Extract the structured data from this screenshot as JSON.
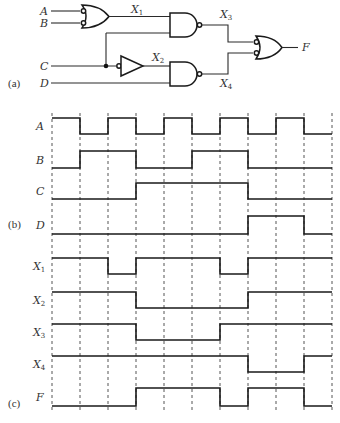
{
  "figure": {
    "part_labels": {
      "a": "(a)",
      "b": "(b)",
      "c": "(c)"
    },
    "circuit": {
      "inputs": [
        "A",
        "B",
        "C",
        "D"
      ],
      "intermediate": [
        {
          "name": "X",
          "sub": "1"
        },
        {
          "name": "X",
          "sub": "2"
        },
        {
          "name": "X",
          "sub": "3"
        },
        {
          "name": "X",
          "sub": "4"
        }
      ],
      "output": "F",
      "gates": [
        {
          "id": "g1",
          "type": "OR with inverted inputs",
          "inputs": [
            "A",
            "B"
          ],
          "output": "X1"
        },
        {
          "id": "g2",
          "type": "inverter",
          "inputs": [
            "C"
          ],
          "output": "X2"
        },
        {
          "id": "g3",
          "type": "NAND",
          "inputs": [
            "X1",
            "C"
          ],
          "output": "X3"
        },
        {
          "id": "g4",
          "type": "NAND",
          "inputs": [
            "X2",
            "D"
          ],
          "output": "X4"
        },
        {
          "id": "g5",
          "type": "OR with inverted inputs",
          "inputs": [
            "X3",
            "X4"
          ],
          "output": "F"
        }
      ]
    },
    "timing": {
      "intervals": 10,
      "signals": [
        {
          "name": "A",
          "sub": "",
          "values": [
            1,
            0,
            1,
            0,
            1,
            0,
            1,
            0,
            1,
            0
          ]
        },
        {
          "name": "B",
          "sub": "",
          "values": [
            0,
            1,
            1,
            0,
            0,
            1,
            1,
            0,
            0,
            0
          ]
        },
        {
          "name": "C",
          "sub": "",
          "values": [
            0,
            0,
            0,
            1,
            1,
            1,
            1,
            0,
            0,
            0
          ]
        },
        {
          "name": "D",
          "sub": "",
          "values": [
            0,
            0,
            0,
            0,
            0,
            0,
            0,
            1,
            1,
            0
          ]
        },
        {
          "name": "X",
          "sub": "1",
          "values": [
            1,
            1,
            0,
            1,
            1,
            1,
            0,
            1,
            1,
            1
          ]
        },
        {
          "name": "X",
          "sub": "2",
          "values": [
            1,
            1,
            1,
            0,
            0,
            0,
            0,
            1,
            1,
            1
          ]
        },
        {
          "name": "X",
          "sub": "3",
          "values": [
            1,
            1,
            1,
            0,
            0,
            0,
            1,
            1,
            1,
            1
          ]
        },
        {
          "name": "X",
          "sub": "4",
          "values": [
            1,
            1,
            1,
            1,
            1,
            1,
            1,
            0,
            0,
            1
          ]
        },
        {
          "name": "F",
          "sub": "",
          "values": [
            0,
            0,
            0,
            1,
            1,
            1,
            0,
            1,
            1,
            0
          ]
        }
      ]
    }
  }
}
